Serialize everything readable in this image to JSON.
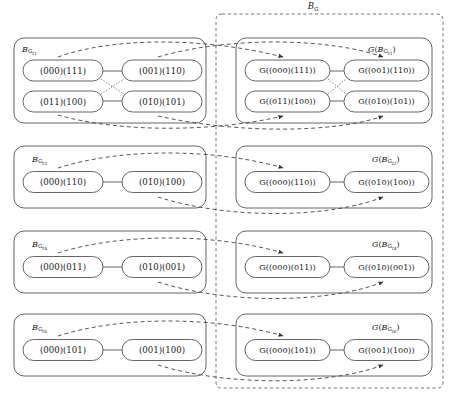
{
  "figure": {
    "type": "commutative-diagram",
    "outer_container_label": "B_G"
  },
  "rows": [
    {
      "left_label": {
        "base": "B",
        "sub": "G",
        "sub2": "t",
        "index": "1"
      },
      "right_label": {
        "prefix": "G(",
        "base": "B",
        "sub": "G",
        "sub2": "t",
        "index": "1",
        "suffix": ")"
      },
      "layout": "2x2",
      "left_nodes": [
        {
          "id": "r1n1",
          "text": "(000)(111)"
        },
        {
          "id": "r1n2",
          "text": "(001)(110)"
        },
        {
          "id": "r1n3",
          "text": "(011)(100)"
        },
        {
          "id": "r1n4",
          "text": "(010)(101)"
        }
      ],
      "right_nodes": [
        {
          "id": "r1g1",
          "text": "G((000)(111))"
        },
        {
          "id": "r1g2",
          "text": "G((001)(110))"
        },
        {
          "id": "r1g3",
          "text": "G((011)(100))"
        },
        {
          "id": "r1g4",
          "text": "G((010)(101))"
        }
      ],
      "solid_edges": [
        [
          "r1n1",
          "r1n2"
        ],
        [
          "r1n3",
          "r1n4"
        ]
      ],
      "dotted_edges": [
        [
          "r1n1",
          "r1n4"
        ],
        [
          "r1n3",
          "r1n2"
        ]
      ]
    },
    {
      "left_label": {
        "base": "B",
        "sub": "G",
        "sub2": "t",
        "index": "2"
      },
      "right_label": {
        "prefix": "G(",
        "base": "B",
        "sub": "G",
        "sub2": "t",
        "index": "2",
        "suffix": ")"
      },
      "layout": "1x2",
      "left_nodes": [
        {
          "id": "r2n1",
          "text": "(000)(110)"
        },
        {
          "id": "r2n2",
          "text": "(010)(100)"
        }
      ],
      "right_nodes": [
        {
          "id": "r2g1",
          "text": "G((000)(110))"
        },
        {
          "id": "r2g2",
          "text": "G((010)(100))"
        }
      ],
      "solid_edges": [
        [
          "r2n1",
          "r2n2"
        ]
      ],
      "dotted_edges": []
    },
    {
      "left_label": {
        "base": "B",
        "sub": "G",
        "sub2": "t",
        "index": "4"
      },
      "right_label": {
        "prefix": "G(",
        "base": "B",
        "sub": "G",
        "sub2": "t",
        "index": "4",
        "suffix": ")"
      },
      "layout": "1x2",
      "left_nodes": [
        {
          "id": "r3n1",
          "text": "(000)(011)"
        },
        {
          "id": "r3n2",
          "text": "(010)(001)"
        }
      ],
      "right_nodes": [
        {
          "id": "r3g1",
          "text": "G((000)(011))"
        },
        {
          "id": "r3g2",
          "text": "G((010)(001))"
        }
      ],
      "solid_edges": [
        [
          "r3n1",
          "r3n2"
        ]
      ],
      "dotted_edges": []
    },
    {
      "left_label": {
        "base": "B",
        "sub": "G",
        "sub2": "t",
        "index": "6"
      },
      "right_label": {
        "prefix": "G(",
        "base": "B",
        "sub": "G",
        "sub2": "t",
        "index": "6",
        "suffix": ")"
      },
      "layout": "1x2",
      "left_nodes": [
        {
          "id": "r4n1",
          "text": "(000)(101)"
        },
        {
          "id": "r4n2",
          "text": "(001)(100)"
        }
      ],
      "right_nodes": [
        {
          "id": "r4g1",
          "text": "G((000)(101))"
        },
        {
          "id": "r4g2",
          "text": "G((001)(100))"
        }
      ],
      "solid_edges": [
        [
          "r4n1",
          "r4n2"
        ]
      ],
      "dotted_edges": []
    }
  ],
  "style": {
    "stroke": "#555555",
    "node_stroke": "#555555",
    "dashed_stroke": "#444444",
    "background": "#ffffff"
  }
}
